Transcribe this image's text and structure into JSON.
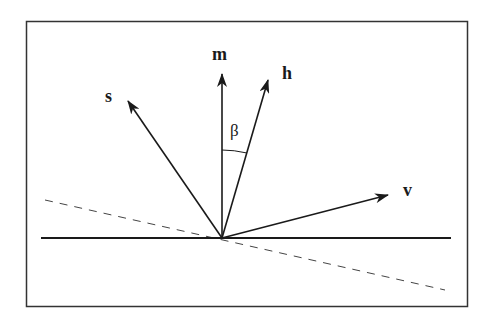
{
  "diagram": {
    "frame": {
      "x": 26,
      "y": 21,
      "width": 441,
      "height": 285,
      "stroke": "#333333"
    },
    "origin": {
      "x": 222,
      "y": 238
    },
    "surface_line": {
      "x1": 41,
      "y1": 238,
      "x2": 451,
      "y2": 238
    },
    "tangent_dashed_line": {
      "x1": 45,
      "y1": 200,
      "x2": 445,
      "y2": 290
    },
    "vectors": [
      {
        "id": "s",
        "label": "s",
        "tip": {
          "x": 128,
          "y": 101
        },
        "label_pos": {
          "x": 105,
          "y": 102
        }
      },
      {
        "id": "m",
        "label": "m",
        "tip": {
          "x": 222,
          "y": 74
        },
        "label_pos": {
          "x": 212,
          "y": 60
        }
      },
      {
        "id": "h",
        "label": "h",
        "tip": {
          "x": 268,
          "y": 80
        },
        "label_pos": {
          "x": 282,
          "y": 79
        }
      },
      {
        "id": "v",
        "label": "v",
        "tip": {
          "x": 388,
          "y": 195
        },
        "label_pos": {
          "x": 403,
          "y": 196
        }
      }
    ],
    "angle": {
      "label": "β",
      "between": [
        "m",
        "h"
      ],
      "label_pos": {
        "x": 230,
        "y": 136
      }
    }
  }
}
